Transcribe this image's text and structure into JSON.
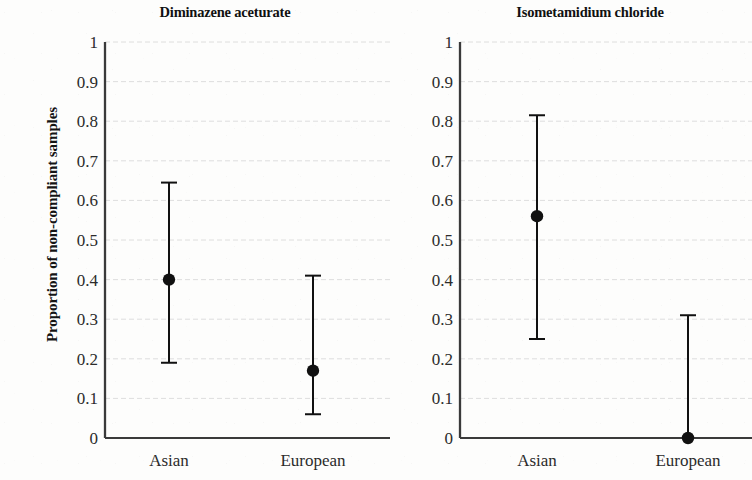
{
  "figure": {
    "ylabel": "Proportion of non-compliant samples",
    "background": "#fdfdfc",
    "marker_color": "#111111",
    "axis_color": "#3a3a3a",
    "grid_color": "#d8d8d8",
    "tick_text_color": "#2b2b2b"
  },
  "chart_data": [
    {
      "type": "scatter",
      "title": "Diminazene aceturate",
      "xlabel": "",
      "ylabel": "Proportion of non-compliant samples",
      "categories": [
        "Asian",
        "European"
      ],
      "values": [
        0.4,
        0.17
      ],
      "error_low": [
        0.19,
        0.06
      ],
      "error_high": [
        0.645,
        0.41
      ],
      "ylim": [
        0,
        1
      ],
      "yticks": [
        0,
        0.1,
        0.2,
        0.3,
        0.4,
        0.5,
        0.6,
        0.7,
        0.8,
        0.9,
        1
      ],
      "ytick_labels": [
        "0",
        "0.1",
        "0.2",
        "0.3",
        "0.4",
        "0.5",
        "0.6",
        "0.7",
        "0.8",
        "0.9",
        "1"
      ],
      "grid": true,
      "legend": "none",
      "marker": "filled-circle",
      "errorbar": "capped-vertical"
    },
    {
      "type": "scatter",
      "title": "Isometamidium chloride",
      "xlabel": "",
      "ylabel": "",
      "categories": [
        "Asian",
        "European"
      ],
      "values": [
        0.56,
        0.0
      ],
      "error_low": [
        0.25,
        0.0
      ],
      "error_high": [
        0.815,
        0.31
      ],
      "ylim": [
        0,
        1
      ],
      "yticks": [
        0,
        0.1,
        0.2,
        0.3,
        0.4,
        0.5,
        0.6,
        0.7,
        0.8,
        0.9,
        1
      ],
      "ytick_labels": [
        "0",
        "0.1",
        "0.2",
        "0.3",
        "0.4",
        "0.5",
        "0.6",
        "0.7",
        "0.8",
        "0.9",
        "1"
      ],
      "grid": true,
      "legend": "none",
      "marker": "filled-circle",
      "errorbar": "capped-vertical"
    }
  ]
}
